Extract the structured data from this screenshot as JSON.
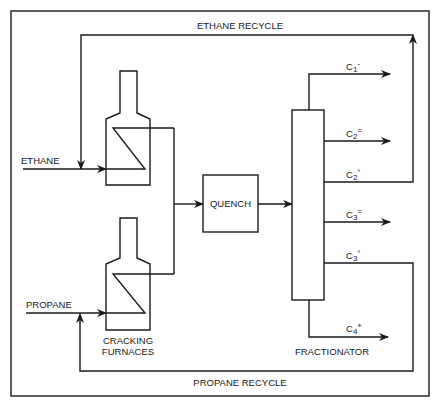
{
  "diagram": {
    "type": "process-flow",
    "colors": {
      "line": "#1a1a1a",
      "background": "#ffffff"
    },
    "recycles": {
      "ethane": "ETHANE RECYCLE",
      "propane": "PROPANE RECYCLE"
    },
    "feeds": {
      "ethane": "ETHANE",
      "propane": "PROPANE"
    },
    "units": {
      "furnaces_line1": "CRACKING",
      "furnaces_line2": "FURNACES",
      "quench": "QUENCH",
      "fractionator": "FRACTIONATOR"
    },
    "products": [
      {
        "base": "C",
        "sub": "1",
        "sup": "-"
      },
      {
        "base": "C",
        "sub": "2",
        "sup": "="
      },
      {
        "base": "C",
        "sub": "2",
        "sup": "°"
      },
      {
        "base": "C",
        "sub": "3",
        "sup": "="
      },
      {
        "base": "C",
        "sub": "3",
        "sup": "°"
      },
      {
        "base": "C",
        "sub": "4",
        "sup": "+"
      }
    ]
  }
}
